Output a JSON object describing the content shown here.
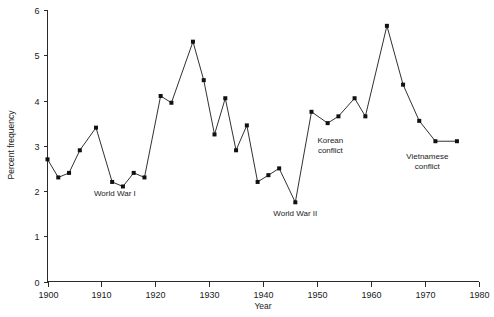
{
  "chart_data": {
    "type": "line",
    "title": "",
    "xlabel": "Year",
    "ylabel": "Percent frequency",
    "xlim": [
      1900,
      1980
    ],
    "ylim": [
      0,
      6
    ],
    "grid": false,
    "legend": "none",
    "xticks": [
      1900,
      1910,
      1920,
      1930,
      1940,
      1950,
      1960,
      1970,
      1980
    ],
    "xticklabels": [
      "1900",
      "1910",
      "1920",
      "1930",
      "1940",
      "1950",
      "1960",
      "1970",
      "1980"
    ],
    "yticks": [
      0,
      1,
      2,
      3,
      4,
      5,
      6
    ],
    "yticklabels": [
      "0",
      "1",
      "2",
      "3",
      "4",
      "5",
      "6"
    ],
    "series": [
      {
        "name": "Percent frequency",
        "marker": "square",
        "x": [
          1900,
          1902,
          1904,
          1906,
          1909,
          1912,
          1914,
          1916,
          1918,
          1921,
          1923,
          1927,
          1929,
          1931,
          1933,
          1935,
          1937,
          1939,
          1941,
          1943,
          1946,
          1949,
          1952,
          1954,
          1957,
          1959,
          1963,
          1966,
          1969,
          1972,
          1976
        ],
        "values": [
          2.7,
          2.3,
          2.4,
          2.9,
          3.4,
          2.2,
          2.1,
          2.4,
          2.3,
          4.1,
          3.95,
          5.3,
          4.45,
          3.25,
          4.05,
          2.9,
          3.45,
          2.2,
          2.35,
          2.5,
          1.75,
          3.75,
          3.5,
          3.65,
          4.05,
          3.65,
          5.65,
          4.35,
          3.55,
          3.1,
          3.1
        ]
      }
    ],
    "annotations": [
      {
        "id": "ww1",
        "text": "World War I",
        "x": 1912.5,
        "y": 1.9
      },
      {
        "id": "ww2",
        "text": "World War II",
        "x": 1946.0,
        "y": 1.45
      },
      {
        "id": "korean",
        "text_line1": "Korean",
        "text_line2": "conflict",
        "x": 1952.5,
        "y": 3.05
      },
      {
        "id": "vietnam",
        "text_line1": "Vietnamese",
        "text_line2": "conflict",
        "x": 1970.5,
        "y": 2.7
      }
    ]
  },
  "colors": {
    "line": "#1a1a1a",
    "marker": "#111111",
    "axis": "#2a2a2a",
    "background": "#ffffff"
  }
}
